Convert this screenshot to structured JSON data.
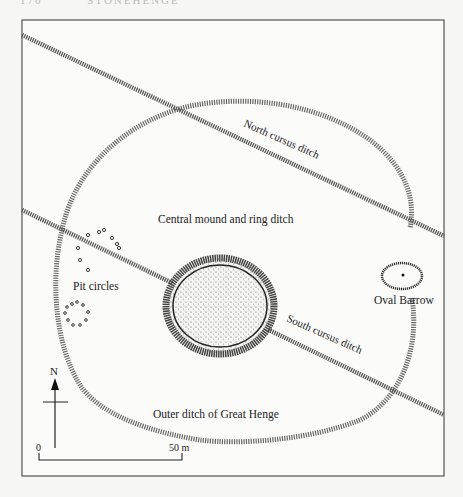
{
  "header": {
    "page_number": "170",
    "running_title": "STONEHENGE"
  },
  "figure": {
    "labels": {
      "north_cursus": "North cursus ditch",
      "south_cursus": "South cursus ditch",
      "central_mound": "Central mound and ring ditch",
      "pit_circles": "Pit circles",
      "oval_barrow": "Oval Barrow",
      "outer_ditch": "Outer ditch of Great Henge"
    },
    "north_arrow": {
      "label": "N"
    },
    "scale_bar": {
      "start_label": "0",
      "end_label": "50 m"
    },
    "colors": {
      "ink": "#222222",
      "stipple": "#555555",
      "background": "#f6f6f4",
      "frame": "#333333"
    }
  }
}
